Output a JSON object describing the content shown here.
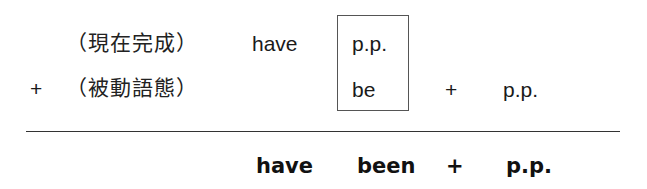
{
  "row1": {
    "label": "（現在完成）",
    "aux": "have",
    "boxed_top": "p.p."
  },
  "row2": {
    "plus_prefix": "+",
    "label": "（被動語態）",
    "boxed_bottom": "be",
    "plus": "+",
    "participle": "p.p."
  },
  "result": {
    "aux": "have",
    "been": "been",
    "plus": "+",
    "participle": "p.p."
  }
}
